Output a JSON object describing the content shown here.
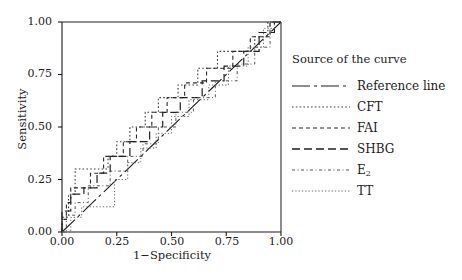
{
  "chart_data": {
    "type": "line",
    "title": "",
    "xlabel": "1−Specificity",
    "ylabel": "Sensitivity",
    "xlim": [
      0.0,
      1.0
    ],
    "ylim": [
      0.0,
      1.0
    ],
    "xticks": [
      "0.00",
      "0.25",
      "0.50",
      "0.75",
      "1.00"
    ],
    "xtick_values": [
      0.0,
      0.25,
      0.5,
      0.75,
      1.0
    ],
    "yticks": [
      "0.00",
      "0.25",
      "0.50",
      "0.75",
      "1.00"
    ],
    "ytick_values": [
      0.0,
      0.25,
      0.5,
      0.75,
      1.0
    ],
    "grid": false,
    "legend_position": "right",
    "legend_title": "Source of the curve",
    "series": [
      {
        "name": "Reference line",
        "dash": "18,4,3,4,18,4,3,4",
        "width": 1.1,
        "color": "#1a1a1a",
        "step": false,
        "points": [
          [
            0.0,
            0.0
          ],
          [
            1.0,
            1.0
          ]
        ]
      },
      {
        "name": "CFT",
        "dash": "1.6,2.2",
        "width": 1.1,
        "color": "#3c3c3c",
        "step": true,
        "points": [
          [
            0.0,
            0.0
          ],
          [
            0.0,
            0.07
          ],
          [
            0.03,
            0.07
          ],
          [
            0.03,
            0.18
          ],
          [
            0.06,
            0.18
          ],
          [
            0.06,
            0.3
          ],
          [
            0.21,
            0.3
          ],
          [
            0.21,
            0.36
          ],
          [
            0.25,
            0.36
          ],
          [
            0.25,
            0.43
          ],
          [
            0.31,
            0.43
          ],
          [
            0.31,
            0.5
          ],
          [
            0.38,
            0.5
          ],
          [
            0.38,
            0.57
          ],
          [
            0.44,
            0.57
          ],
          [
            0.44,
            0.64
          ],
          [
            0.53,
            0.64
          ],
          [
            0.53,
            0.7
          ],
          [
            0.62,
            0.7
          ],
          [
            0.62,
            0.78
          ],
          [
            0.71,
            0.78
          ],
          [
            0.71,
            0.86
          ],
          [
            0.88,
            0.86
          ],
          [
            0.88,
            0.93
          ],
          [
            0.94,
            0.93
          ],
          [
            0.94,
            1.0
          ],
          [
            1.0,
            1.0
          ]
        ]
      },
      {
        "name": "FAI",
        "dash": "4,3",
        "width": 1.1,
        "color": "#2a2a2a",
        "step": true,
        "points": [
          [
            0.0,
            0.0
          ],
          [
            0.0,
            0.06
          ],
          [
            0.02,
            0.06
          ],
          [
            0.02,
            0.14
          ],
          [
            0.04,
            0.14
          ],
          [
            0.04,
            0.21
          ],
          [
            0.13,
            0.21
          ],
          [
            0.13,
            0.28
          ],
          [
            0.19,
            0.28
          ],
          [
            0.19,
            0.36
          ],
          [
            0.28,
            0.36
          ],
          [
            0.28,
            0.43
          ],
          [
            0.34,
            0.43
          ],
          [
            0.34,
            0.5
          ],
          [
            0.41,
            0.5
          ],
          [
            0.41,
            0.57
          ],
          [
            0.48,
            0.57
          ],
          [
            0.48,
            0.64
          ],
          [
            0.56,
            0.64
          ],
          [
            0.56,
            0.71
          ],
          [
            0.66,
            0.71
          ],
          [
            0.66,
            0.78
          ],
          [
            0.78,
            0.78
          ],
          [
            0.78,
            0.86
          ],
          [
            0.86,
            0.86
          ],
          [
            0.86,
            0.93
          ],
          [
            0.95,
            0.93
          ],
          [
            0.95,
            1.0
          ],
          [
            1.0,
            1.0
          ]
        ]
      },
      {
        "name": "SHBG",
        "dash": "8,4",
        "width": 1.2,
        "color": "#202020",
        "step": true,
        "points": [
          [
            0.0,
            0.0
          ],
          [
            0.0,
            0.1
          ],
          [
            0.04,
            0.1
          ],
          [
            0.04,
            0.18
          ],
          [
            0.1,
            0.18
          ],
          [
            0.1,
            0.21
          ],
          [
            0.16,
            0.21
          ],
          [
            0.16,
            0.28
          ],
          [
            0.22,
            0.28
          ],
          [
            0.22,
            0.36
          ],
          [
            0.31,
            0.36
          ],
          [
            0.31,
            0.43
          ],
          [
            0.4,
            0.43
          ],
          [
            0.4,
            0.5
          ],
          [
            0.46,
            0.5
          ],
          [
            0.46,
            0.57
          ],
          [
            0.54,
            0.57
          ],
          [
            0.54,
            0.64
          ],
          [
            0.64,
            0.64
          ],
          [
            0.64,
            0.72
          ],
          [
            0.74,
            0.72
          ],
          [
            0.74,
            0.79
          ],
          [
            0.83,
            0.79
          ],
          [
            0.83,
            0.86
          ],
          [
            0.9,
            0.86
          ],
          [
            0.9,
            0.95
          ],
          [
            0.97,
            0.95
          ],
          [
            0.97,
            1.0
          ],
          [
            1.0,
            1.0
          ]
        ]
      },
      {
        "name": "E₂",
        "dash": "3,2.5,1,2.5",
        "width": 1.0,
        "color": "#555555",
        "step": true,
        "points": [
          [
            0.0,
            0.0
          ],
          [
            0.02,
            0.0
          ],
          [
            0.02,
            0.08
          ],
          [
            0.06,
            0.08
          ],
          [
            0.06,
            0.14
          ],
          [
            0.12,
            0.14
          ],
          [
            0.12,
            0.22
          ],
          [
            0.22,
            0.22
          ],
          [
            0.22,
            0.29
          ],
          [
            0.3,
            0.29
          ],
          [
            0.3,
            0.36
          ],
          [
            0.37,
            0.36
          ],
          [
            0.37,
            0.42
          ],
          [
            0.44,
            0.42
          ],
          [
            0.44,
            0.5
          ],
          [
            0.52,
            0.5
          ],
          [
            0.52,
            0.57
          ],
          [
            0.6,
            0.57
          ],
          [
            0.6,
            0.64
          ],
          [
            0.7,
            0.64
          ],
          [
            0.7,
            0.72
          ],
          [
            0.8,
            0.72
          ],
          [
            0.8,
            0.8
          ],
          [
            0.88,
            0.8
          ],
          [
            0.88,
            0.88
          ],
          [
            0.95,
            0.88
          ],
          [
            0.95,
            1.0
          ],
          [
            1.0,
            1.0
          ]
        ]
      },
      {
        "name": "TT",
        "dash": "1.3,2",
        "width": 1.0,
        "color": "#6a6a6a",
        "step": true,
        "points": [
          [
            0.0,
            0.0
          ],
          [
            0.04,
            0.0
          ],
          [
            0.04,
            0.07
          ],
          [
            0.09,
            0.07
          ],
          [
            0.09,
            0.12
          ],
          [
            0.24,
            0.12
          ],
          [
            0.24,
            0.25
          ],
          [
            0.3,
            0.25
          ],
          [
            0.3,
            0.33
          ],
          [
            0.36,
            0.33
          ],
          [
            0.36,
            0.4
          ],
          [
            0.43,
            0.4
          ],
          [
            0.43,
            0.47
          ],
          [
            0.5,
            0.47
          ],
          [
            0.5,
            0.55
          ],
          [
            0.58,
            0.55
          ],
          [
            0.58,
            0.63
          ],
          [
            0.67,
            0.63
          ],
          [
            0.67,
            0.7
          ],
          [
            0.76,
            0.7
          ],
          [
            0.76,
            0.79
          ],
          [
            0.85,
            0.79
          ],
          [
            0.85,
            0.88
          ],
          [
            0.92,
            0.88
          ],
          [
            0.92,
            0.97
          ],
          [
            0.97,
            0.97
          ],
          [
            0.97,
            1.0
          ],
          [
            1.0,
            1.0
          ]
        ]
      }
    ]
  },
  "legend": {
    "title": "Source of the curve",
    "items": [
      {
        "label": "Reference line",
        "dash": "18,4,3,4,18,4,3,4",
        "width": 1.2,
        "color": "#1a1a1a"
      },
      {
        "label": "CFT",
        "dash": "1.6,2.2",
        "width": 1.1,
        "color": "#3c3c3c"
      },
      {
        "label": "FAI",
        "dash": "4,3",
        "width": 1.1,
        "color": "#2a2a2a"
      },
      {
        "label": "SHBG",
        "dash": "8,4",
        "width": 1.3,
        "color": "#202020"
      },
      {
        "label": "E",
        "label_sub": "2",
        "dash": "3,2.5,1,2.5",
        "width": 1.0,
        "color": "#555555"
      },
      {
        "label": "TT",
        "dash": "1.3,2",
        "width": 1.0,
        "color": "#6a6a6a"
      }
    ]
  },
  "axes": {
    "x_title": "1−Specificity",
    "y_title": "Sensitivity",
    "x_tick_labels": [
      "0.00",
      "0.25",
      "0.50",
      "0.75",
      "1.00"
    ],
    "y_tick_labels": [
      "0.00",
      "0.25",
      "0.50",
      "0.75",
      "1.00"
    ],
    "axis_color": "#1a1a1a"
  }
}
